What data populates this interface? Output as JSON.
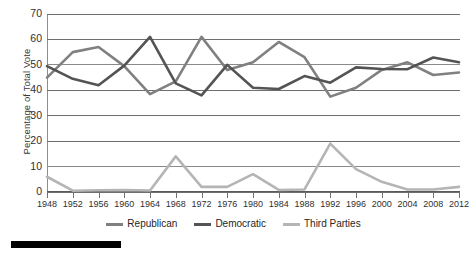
{
  "chart_data": {
    "type": "line",
    "title": "",
    "xlabel": "",
    "ylabel": "Percentage of Total Vote",
    "ylim": [
      0,
      70
    ],
    "ytick_step": 10,
    "yticks": [
      0,
      10,
      20,
      30,
      40,
      50,
      60,
      70
    ],
    "grid": true,
    "legend_position": "bottom-center",
    "categories": [
      "1948",
      "1952",
      "1956",
      "1960",
      "1964",
      "1968",
      "1972",
      "1976",
      "1980",
      "1984",
      "1988",
      "1992",
      "1996",
      "2000",
      "2004",
      "2008",
      "2012"
    ],
    "series": [
      {
        "name": "Republican",
        "color": "#808080",
        "values": [
          45,
          55,
          57,
          49.5,
          38.5,
          43.5,
          61,
          48,
          51,
          59,
          53,
          37.5,
          41,
          48,
          51,
          46,
          47
        ]
      },
      {
        "name": "Democratic",
        "color": "#545454",
        "values": [
          49.5,
          44.5,
          42,
          49.7,
          61,
          42.7,
          38,
          50,
          41,
          40.5,
          45.6,
          43,
          49,
          48.4,
          48.3,
          52.9,
          51
        ]
      },
      {
        "name": "Third Parties",
        "color": "#b5b5b5",
        "values": [
          6,
          0.5,
          0.7,
          0.8,
          0.6,
          14,
          2,
          2,
          7,
          0.8,
          1,
          19,
          9,
          4,
          1,
          1,
          2
        ]
      }
    ]
  },
  "axes": {
    "y_title": "Percentage of Total Vote",
    "y_tick_labels": [
      "70",
      "60",
      "50",
      "40",
      "30",
      "20",
      "10",
      "0"
    ],
    "x_tick_labels": [
      "1948",
      "1952",
      "1956",
      "1960",
      "1964",
      "1968",
      "1972",
      "1976",
      "1980",
      "1984",
      "1988",
      "1992",
      "1996",
      "2000",
      "2004",
      "2008",
      "2012"
    ]
  },
  "legend": {
    "items": [
      {
        "label": "Republican",
        "color": "#808080"
      },
      {
        "label": "Democratic",
        "color": "#545454"
      },
      {
        "label": "Third Parties",
        "color": "#b5b5b5"
      }
    ]
  },
  "colors": {
    "republican": "#808080",
    "democratic": "#545454",
    "third_parties": "#b5b5b5",
    "gridline": "#6e6e6e",
    "text": "#2f2f2f",
    "rule": "#000000"
  }
}
